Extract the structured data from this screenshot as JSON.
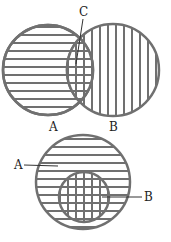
{
  "colors": {
    "stroke": "#707070",
    "label": "#222222",
    "background": "#ffffff"
  },
  "top_diagram": {
    "description": "Two overlapping sets A and B; intersection labeled C",
    "labels": {
      "a": "A",
      "b": "B",
      "c": "C"
    },
    "circle_a": {
      "cx": 48,
      "cy": 70,
      "r": 45,
      "hatch": "horizontal"
    },
    "circle_b": {
      "cx": 113,
      "cy": 70,
      "r": 46,
      "hatch": "vertical"
    }
  },
  "bottom_diagram": {
    "description": "Set B is a subset of set A",
    "labels": {
      "a": "A",
      "b": "B"
    },
    "circle_a": {
      "cx": 83,
      "cy": 182,
      "r": 47,
      "hatch": "horizontal"
    },
    "circle_b": {
      "cx": 84,
      "cy": 197,
      "r": 25,
      "hatch": "grid"
    }
  }
}
